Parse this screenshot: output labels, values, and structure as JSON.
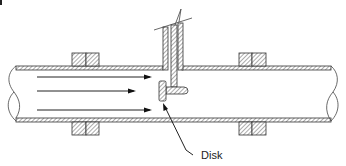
{
  "figure": {
    "corner_mark": "",
    "labels": {
      "disk": "Disk"
    },
    "components": [
      {
        "id": "pipe",
        "name": "Pipe (sectioned wall)"
      },
      {
        "id": "flange-upstream",
        "name": "Upstream flange pair"
      },
      {
        "id": "flange-downstream",
        "name": "Downstream flange pair"
      },
      {
        "id": "stem",
        "name": "Vertical stem / support rod through top wall"
      },
      {
        "id": "disk",
        "name": "Disk facing upstream flow"
      },
      {
        "id": "flow-arrows",
        "name": "Flow direction arrows (left to right)",
        "count": 3
      }
    ],
    "flow_direction": "left-to-right",
    "colors": {
      "line": "#333333",
      "background": "#ffffff"
    }
  }
}
